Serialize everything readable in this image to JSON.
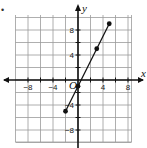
{
  "problem_bullet": "•",
  "chart_data": {
    "type": "line",
    "title": "",
    "xlabel": "x",
    "ylabel": "y",
    "origin_label": "O",
    "xlim": [
      -10,
      9
    ],
    "ylim": [
      -10,
      10
    ],
    "grid": true,
    "grid_step": 2,
    "x_tick_labels": [
      {
        "value": -8,
        "label": "−8"
      },
      {
        "value": -4,
        "label": "−4"
      },
      {
        "value": 4,
        "label": "4"
      },
      {
        "value": 8,
        "label": "8"
      }
    ],
    "y_tick_labels": [
      {
        "value": 8,
        "label": "8"
      },
      {
        "value": 4,
        "label": "4"
      },
      {
        "value": -4,
        "label": "−4"
      },
      {
        "value": -8,
        "label": "−8"
      }
    ],
    "series": [
      {
        "name": "line segment",
        "equation": "y = 2x − 1",
        "x": [
          -2,
          0,
          3,
          5
        ],
        "y": [
          -5,
          -1,
          5,
          9
        ],
        "points_marked": true,
        "color": "#111111"
      }
    ]
  }
}
